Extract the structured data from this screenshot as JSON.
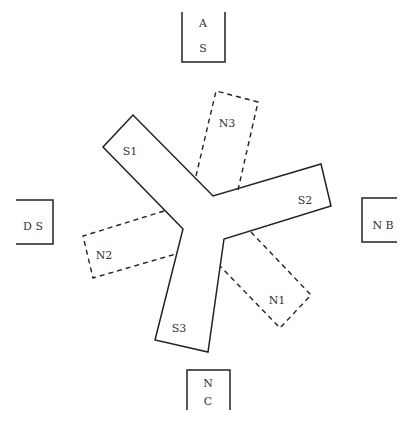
{
  "diagram": {
    "type": "layout-schematic",
    "boxes": [
      {
        "id": "top",
        "lines": [
          "A",
          "S"
        ]
      },
      {
        "id": "left",
        "lines": [
          "D S"
        ]
      },
      {
        "id": "right",
        "lines": [
          "N B"
        ]
      },
      {
        "id": "bottom",
        "lines": [
          "N",
          "C"
        ]
      }
    ],
    "solid_arms": [
      {
        "label": "S1"
      },
      {
        "label": "S2"
      },
      {
        "label": "S3"
      }
    ],
    "dashed_regions": [
      {
        "label": "N1"
      },
      {
        "label": "N2"
      },
      {
        "label": "N3"
      }
    ],
    "colors": {
      "stroke": "#222222",
      "text": "#333333",
      "background": "#ffffff"
    }
  }
}
